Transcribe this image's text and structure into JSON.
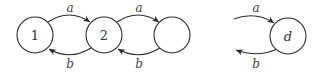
{
  "diagram": {
    "type": "state-transition",
    "nodes": [
      {
        "id": "n1",
        "label": "1",
        "cx": 35,
        "cy": 35
      },
      {
        "id": "n2",
        "label": "2",
        "cx": 104,
        "cy": 35
      },
      {
        "id": "n3",
        "label": "",
        "cx": 172,
        "cy": 35
      },
      {
        "id": "nd",
        "label": "d",
        "cx": 288,
        "cy": 36
      }
    ],
    "edges": [
      {
        "from": "1",
        "to": "2",
        "label": "a"
      },
      {
        "from": "2",
        "to": "1",
        "label": "b"
      },
      {
        "from": "2",
        "to": "(unlabeled)",
        "label": "a"
      },
      {
        "from": "(unlabeled)",
        "to": "2",
        "label": "b"
      },
      {
        "from": "(left, open)",
        "to": "d",
        "label": "a"
      },
      {
        "from": "d",
        "to": "(left, open)",
        "label": "b"
      }
    ],
    "colors": {
      "stroke": "#2a2a2a",
      "text": "#333333"
    }
  }
}
